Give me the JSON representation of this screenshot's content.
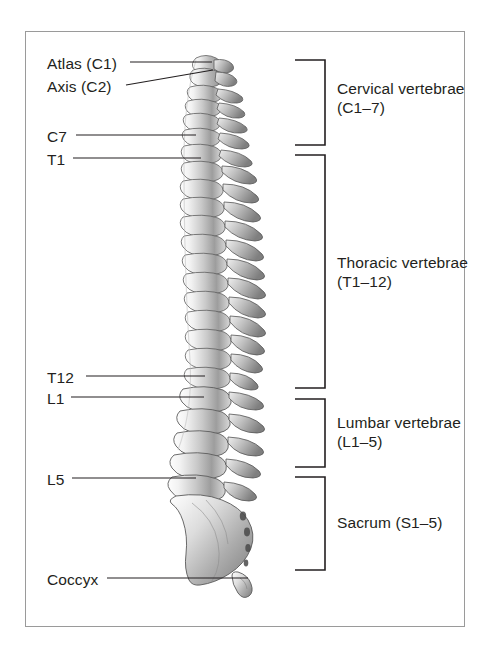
{
  "figure": {
    "frame_color": "#9a9a9a",
    "text_color": "#231f20",
    "leader_color": "#231f20",
    "left_labels": [
      {
        "id": "atlas",
        "text": "Atlas (C1)",
        "x": 47,
        "y": 66,
        "line_from_x": 130,
        "line_from_y": 62,
        "line_to_x": 212,
        "line_to_y": 62
      },
      {
        "id": "axis",
        "text": "Axis (C2)",
        "x": 47,
        "y": 89,
        "line_from_x": 126,
        "line_from_y": 85,
        "line_to_x": 213,
        "line_to_y": 70
      },
      {
        "id": "c7",
        "text": "C7",
        "x": 47,
        "y": 139,
        "line_from_x": 76,
        "line_from_y": 135,
        "line_to_x": 196,
        "line_to_y": 135
      },
      {
        "id": "t1",
        "text": "T1",
        "x": 47,
        "y": 162,
        "line_from_x": 73,
        "line_from_y": 158,
        "line_to_x": 201,
        "line_to_y": 158
      },
      {
        "id": "t12",
        "text": "T12",
        "x": 47,
        "y": 380,
        "line_from_x": 86,
        "line_from_y": 376,
        "line_to_x": 205,
        "line_to_y": 376
      },
      {
        "id": "l1",
        "text": "L1",
        "x": 47,
        "y": 401,
        "line_from_x": 71,
        "line_from_y": 397,
        "line_to_x": 204,
        "line_to_y": 397
      },
      {
        "id": "l5",
        "text": "L5",
        "x": 47,
        "y": 482,
        "line_from_x": 72,
        "line_from_y": 478,
        "line_to_x": 196,
        "line_to_y": 478
      },
      {
        "id": "coccyx",
        "text": "Coccyx",
        "x": 47,
        "y": 582,
        "line_from_x": 107,
        "line_from_y": 578,
        "line_to_x": 248,
        "line_to_y": 578
      }
    ],
    "regions": [
      {
        "id": "cervical",
        "line1": "Cervical vertebrae",
        "line2": "(C1–7)",
        "text_x": 337,
        "text_y": 88,
        "top": 60,
        "bottom": 145
      },
      {
        "id": "thoracic",
        "line1": "Thoracic vertebrae",
        "line2": "(T1–12)",
        "text_x": 337,
        "text_y": 262,
        "top": 155,
        "bottom": 388
      },
      {
        "id": "lumbar",
        "line1": "Lumbar vertebrae",
        "line2": "(L1–5)",
        "text_x": 337,
        "text_y": 422,
        "top": 399,
        "bottom": 467
      },
      {
        "id": "sacrum",
        "line1": "Sacrum (S1–5)",
        "line2": "",
        "text_x": 337,
        "text_y": 522,
        "top": 477,
        "bottom": 570
      }
    ],
    "bracket": {
      "tip_x": 295,
      "spine_x": 325
    }
  }
}
